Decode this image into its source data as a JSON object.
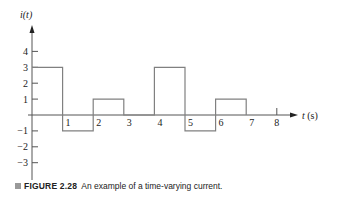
{
  "chart_data": {
    "type": "line",
    "subtype": "step",
    "title": "",
    "xlabel": "t (s)",
    "ylabel": "i(t)",
    "x_ticks": [
      1,
      2,
      3,
      4,
      5,
      6,
      7,
      8
    ],
    "y_ticks": [
      4,
      3,
      2,
      1,
      -1,
      -2,
      -3
    ],
    "xlim": [
      0,
      8.5
    ],
    "ylim": [
      -4,
      5
    ],
    "grid": false,
    "legend": null,
    "segments": [
      {
        "x_start": 0,
        "x_end": 1,
        "value": 3
      },
      {
        "x_start": 1,
        "x_end": 2,
        "value": -1
      },
      {
        "x_start": 2,
        "x_end": 3,
        "value": 1
      },
      {
        "x_start": 3,
        "x_end": 4,
        "value": 0
      },
      {
        "x_start": 4,
        "x_end": 5,
        "value": 3
      },
      {
        "x_start": 5,
        "x_end": 6,
        "value": -1
      },
      {
        "x_start": 6,
        "x_end": 7,
        "value": 1
      }
    ],
    "line_color": "#808080",
    "axis_color": "#555555"
  },
  "caption": {
    "label": "FIGURE 2.28",
    "text": "An example of a time-varying current."
  }
}
